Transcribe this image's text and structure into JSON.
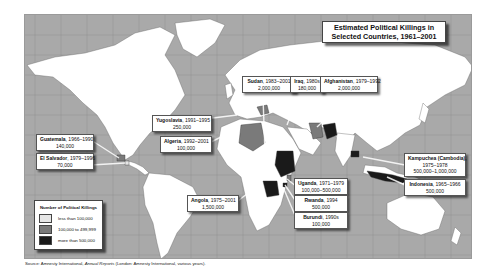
{
  "title": {
    "line1": "Estimated Political Killings in",
    "line2": "Selected Countries, 1961–2001"
  },
  "legend": {
    "title": "Number of Political Killings",
    "items": [
      {
        "label": "less than 100,000",
        "color": "#e6e6e6"
      },
      {
        "label": "100,000 to 499,999",
        "color": "#7a7a7a"
      },
      {
        "label": "more than 500,000",
        "color": "#1a1a1a"
      }
    ]
  },
  "countries": [
    {
      "name": "Sudan",
      "period": "1983–2001",
      "killings": "2,000,000",
      "category": "more than 500,000"
    },
    {
      "name": "Iraq",
      "period": "1980s",
      "killings": "180,000",
      "category": "100,000 to 499,999"
    },
    {
      "name": "Afghanistan",
      "period": "1979–1992",
      "killings": "2,000,000",
      "category": "more than 500,000"
    },
    {
      "name": "Yugoslavia",
      "period": "1991–1995",
      "killings": "250,000",
      "category": "100,000 to 499,999"
    },
    {
      "name": "Algeria",
      "period": "1992–2001",
      "killings": "100,000",
      "category": "100,000 to 499,999"
    },
    {
      "name": "Guatemala",
      "period": "1966–1990",
      "killings": "140,000",
      "category": "100,000 to 499,999"
    },
    {
      "name": "El Salvador",
      "period": "1979–1996",
      "killings": "70,000",
      "category": "less than 100,000"
    },
    {
      "name": "Angola",
      "period": "1975–2001",
      "killings": "1,500,000",
      "category": "more than 500,000"
    },
    {
      "name": "Uganda",
      "period": "1971–1979",
      "killings": "100,000–500,000",
      "category": "100,000 to 499,999"
    },
    {
      "name": "Rwanda",
      "period": "1994",
      "killings": "500,000",
      "category": "more than 500,000"
    },
    {
      "name": "Burundi",
      "period": "1990s",
      "killings": "100,000",
      "category": "100,000 to 499,999"
    },
    {
      "name": "Kampuchea (Cambodia),",
      "period": "1975–1978",
      "killings": "500,000–1,000,000",
      "category": "more than 500,000"
    },
    {
      "name": "Indonesia",
      "period": "1965–1966",
      "killings": "500,000",
      "category": "more than 500,000"
    }
  ],
  "source": {
    "prefix": "Source: Amnesty International, ",
    "title": "Annual Reports",
    "suffix": " (London: Amnesty International, various years)."
  },
  "colors": {
    "ocean": "#a9a9a9",
    "land": "#ffffff",
    "grid": "#8f8f8f"
  }
}
